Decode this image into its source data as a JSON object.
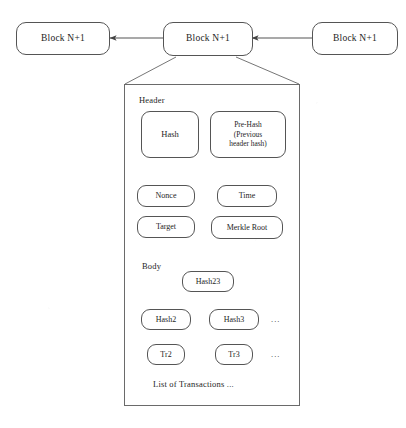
{
  "figure": {
    "kind": "blockchain-block-structure-diagram",
    "ink_color": "#555555",
    "background": "#ffffff"
  },
  "chain": {
    "blocks": [
      {
        "label": "Block N+1",
        "role": "left"
      },
      {
        "label": "Block N+1",
        "role": "middle-expanded"
      },
      {
        "label": "Block N+1",
        "role": "right"
      }
    ],
    "link_direction": "right-to-left"
  },
  "header": {
    "label": "Header",
    "fields": [
      {
        "label": "Hash"
      },
      {
        "line1": "Pre-Hash",
        "line2": "(Previous",
        "line3": "header hash)"
      },
      {
        "label": "Nonce"
      },
      {
        "label": "Time"
      },
      {
        "label": "Target"
      },
      {
        "label": "Merkle Root"
      }
    ]
  },
  "body": {
    "label": "Body",
    "merkle": {
      "root_parent": "Hash23",
      "children": [
        {
          "label": "Hash2"
        },
        {
          "label": "Hash3"
        }
      ],
      "transactions": [
        {
          "label": "Tr2"
        },
        {
          "label": "Tr3"
        }
      ],
      "hash_ellipsis": "...",
      "tx_ellipsis": "..."
    },
    "caption": "List of Transactions  ..."
  }
}
